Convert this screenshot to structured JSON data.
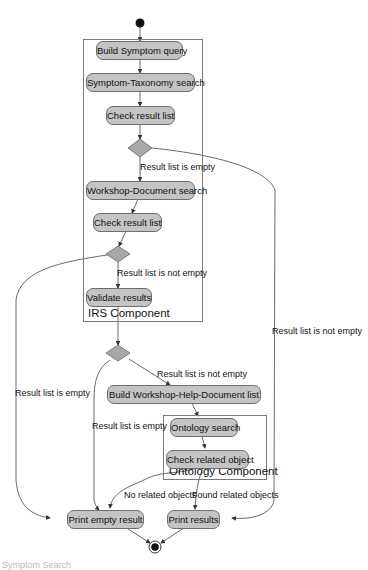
{
  "diagram": {
    "type": "UML activity diagram",
    "start_node": "initial-state",
    "end_node": "final-state",
    "components": [
      {
        "id": "irs",
        "label": "IRS Component"
      },
      {
        "id": "ontology",
        "label": "Ontology Component"
      }
    ],
    "activities": {
      "build_symptom_query": "Build Symptom query",
      "symptom_taxonomy_search": "Symptom-Taxonomy search",
      "check_result_list_1": "Check result list",
      "workshop_document_search": "Workshop-Document search",
      "check_result_list_2": "Check result list",
      "validate_results": "Validate results",
      "build_workshop_help_document_list": "Build Workshop-Help-Document list",
      "ontology_search": "Ontology search",
      "check_related_object": "Check related object",
      "print_empty_result": "Print empty result",
      "print_results": "Print results"
    },
    "edge_labels": {
      "d1_empty": "Result list is empty",
      "d2_not_empty": "Result list is not empty",
      "d1_not_empty": "Result list is not empty",
      "d2_empty": "Result list is empty",
      "d3_not_empty": "Result list is not empty",
      "d3_empty": "Result list is empty",
      "no_related": "No related objects",
      "found_related": "Found related objects"
    },
    "edges": [
      {
        "from": "start",
        "to": "Build Symptom query"
      },
      {
        "from": "Build Symptom query",
        "to": "Symptom-Taxonomy search"
      },
      {
        "from": "Symptom-Taxonomy search",
        "to": "Check result list"
      },
      {
        "from": "Check result list",
        "to": "decision-1"
      },
      {
        "from": "decision-1",
        "to": "Workshop-Document search",
        "label": "Result list is empty"
      },
      {
        "from": "decision-1",
        "to": "Print results",
        "label": "Result list is not empty"
      },
      {
        "from": "Workshop-Document search",
        "to": "Check result list (2)"
      },
      {
        "from": "Check result list (2)",
        "to": "decision-2"
      },
      {
        "from": "decision-2",
        "to": "Validate results",
        "label": "Result list is not empty"
      },
      {
        "from": "decision-2",
        "to": "Print empty result",
        "label": "Result list is empty"
      },
      {
        "from": "Validate results",
        "to": "decision-3"
      },
      {
        "from": "decision-3",
        "to": "Build Workshop-Help-Document list",
        "label": "Result list is not empty"
      },
      {
        "from": "decision-3",
        "to": "Print empty result",
        "label": "Result list is empty"
      },
      {
        "from": "Build Workshop-Help-Document list",
        "to": "Ontology search"
      },
      {
        "from": "Ontology search",
        "to": "Check related object"
      },
      {
        "from": "Check related object",
        "to": "Print empty result",
        "label": "No related objects"
      },
      {
        "from": "Check related object",
        "to": "Print results",
        "label": "Found related objects"
      },
      {
        "from": "Print empty result",
        "to": "end"
      },
      {
        "from": "Print results",
        "to": "end"
      }
    ],
    "colors": {
      "node_fill": "#c4c4c4",
      "node_border": "#6e6e6e",
      "decision_fill": "#a8a8a8",
      "line": "#444444",
      "frame": "#7a7a7a"
    }
  },
  "caption": "Symptom Search"
}
